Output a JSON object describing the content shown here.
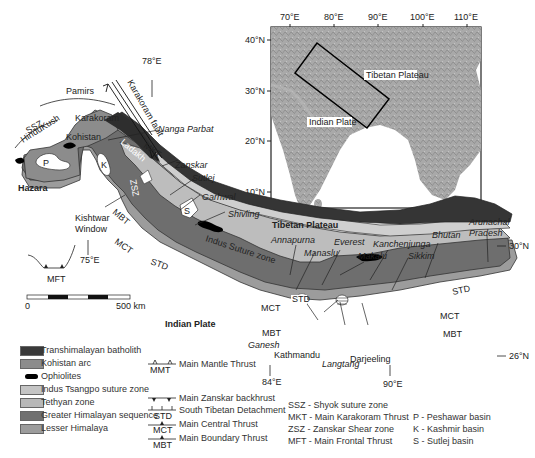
{
  "inset": {
    "lon_ticks": [
      "70°E",
      "80°E",
      "90°E",
      "100°E",
      "110°E"
    ],
    "lat_ticks": [
      "40°N",
      "30°N",
      "20°N",
      "10°N"
    ],
    "labels": {
      "tibetan_plateau": "Tibetan Plateau",
      "indian_plate": "Indian Plate"
    }
  },
  "map": {
    "coords": {
      "lon78": "78°E",
      "lon75": "75°E",
      "lon84": "84°E",
      "lon90": "90°E",
      "lat30": "30°N",
      "lat26": "26°N"
    },
    "regions": {
      "pamirs": "Pamirs",
      "hindukush": "HinduKush",
      "karakoram": "Karakoram",
      "karakoram_fault": "Karakoram fault",
      "kohistan": "Kohistan",
      "ladakh": "Ladakh",
      "hazara": "Hazara",
      "tibetan_plateau": "Tibetan Plateau",
      "indian_plate": "Indian Plate",
      "indus_suture": "Indus Suture zone",
      "kishtwar": "Kishtwar",
      "window": "Window"
    },
    "places": {
      "nanga_parbat": "Nanga Parbat",
      "zanskar": "Zanskar",
      "sutlej": "Sutlej",
      "garhwal": "Garhwal",
      "shivling": "Shivling",
      "annapurna": "Annapurna",
      "manaslu": "Manaslu",
      "everest": "Everest",
      "makalu": "Makalu",
      "kanchenjunga": "Kanchenjunga",
      "sikkim": "Sikkim",
      "bhutan": "Bhutan",
      "arunachal1": "Arunachal",
      "arunachal2": "Pradesh",
      "ganesh": "Ganesh",
      "kathmandu": "Kathmandu",
      "langtang": "Langtang",
      "darjeeling": "Darjeeling"
    },
    "structures": {
      "ssz": "SSZ",
      "mkt": "MKT",
      "zsz": "ZSZ",
      "mft": "MFT",
      "mbt": "MBT",
      "mct": "MCT",
      "std": "STD",
      "p": "P",
      "k": "K",
      "s": "S"
    },
    "scale": {
      "zero": "0",
      "max": "500 km"
    }
  },
  "legend": {
    "units": [
      {
        "label": "Transhimalayan batholith",
        "color": "#3a3a3a"
      },
      {
        "label": "Kohistan arc",
        "color": "#8c8c8c"
      },
      {
        "label": "Ophiolites",
        "color": "#000000"
      },
      {
        "label": "Indus Tsangpo suture zone",
        "color": "#c4c4c4"
      },
      {
        "label": "Tethyan zone",
        "color": "#b8b8b8"
      },
      {
        "label": "Greater Himalayan sequence",
        "color": "#707070"
      },
      {
        "label": "Lesser Himalaya",
        "color": "#9c9c9c"
      }
    ],
    "faults": [
      {
        "abbr": "MMT",
        "label": "Main Mantle Thrust"
      },
      {
        "abbr": "",
        "label": "Main Zanskar backhrust"
      },
      {
        "abbr": "STD",
        "label": "South Tibetan Detachment"
      },
      {
        "abbr": "MCT",
        "label": "Main Central Thrust"
      },
      {
        "abbr": "MBT",
        "label": "Main Boundary Thrust"
      }
    ],
    "abbreviations": [
      "SSZ - Shyok suture zone",
      "MKT - Main Karakoram Thrust",
      "ZSZ - Zanskar Shear zone",
      "MFT - Main Frontal Thrust"
    ],
    "basins": [
      "P - Peshawar basin",
      "K - Kashmir basin",
      "S - Sutlej basin"
    ]
  }
}
